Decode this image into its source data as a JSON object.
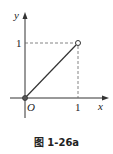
{
  "figure": {
    "caption": "图 1-26a",
    "x_axis_label": "x",
    "y_axis_label": "y",
    "origin_label": "O",
    "x_tick_label": "1",
    "y_tick_label": "1",
    "segment": {
      "from": [
        0,
        0
      ],
      "to": [
        1,
        1
      ],
      "start_point": "filled",
      "end_point": "open"
    },
    "colors": {
      "axis": "#333333",
      "line": "#333333",
      "dashed": "#666666"
    }
  }
}
